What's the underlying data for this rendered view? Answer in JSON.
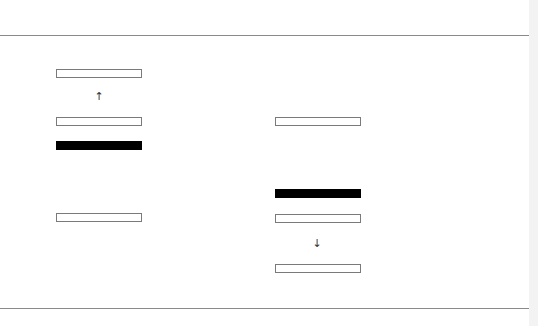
{
  "diagram": {
    "left_column": {
      "cells": [
        {
          "state": "empty"
        },
        {
          "state": "empty"
        },
        {
          "state": "filled"
        },
        {
          "state": "empty"
        }
      ],
      "arrow": {
        "glyph": "↑",
        "direction": "up"
      }
    },
    "right_column": {
      "cells": [
        {
          "state": "empty"
        },
        {
          "state": "filled"
        },
        {
          "state": "empty"
        },
        {
          "state": "empty"
        }
      ],
      "arrow": {
        "glyph": "↓",
        "direction": "down"
      }
    },
    "colors": {
      "filled": "#000000",
      "empty_border": "#7a7a7a",
      "rule": "#8a8a8a"
    }
  }
}
